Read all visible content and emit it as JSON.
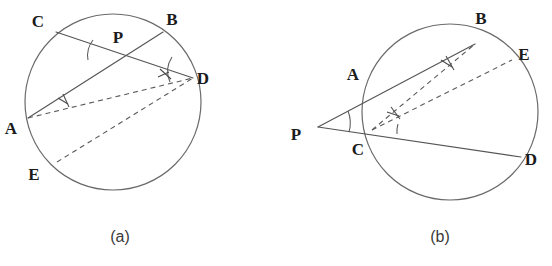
{
  "figure": {
    "background_color": "#ffffff",
    "stroke_color": "#555555",
    "label_color": "#1b1b1b",
    "caption_color": "#3a3a3a"
  },
  "panels": [
    {
      "id": "a",
      "caption": "(a)",
      "caption_x": 120,
      "caption_y": 242,
      "circle": {
        "cx": 113,
        "cy": 102,
        "r": 88
      },
      "points": [
        {
          "name": "C",
          "label": "C",
          "x": 56,
          "y": 32,
          "label_x": 38,
          "label_y": 27
        },
        {
          "name": "B",
          "label": "B",
          "x": 163,
          "y": 32,
          "label_x": 172,
          "label_y": 25
        },
        {
          "name": "P",
          "label": "P",
          "x": 110,
          "y": 48,
          "label_x": 118,
          "label_y": 43
        },
        {
          "name": "D",
          "label": "D",
          "x": 193,
          "y": 78,
          "label_x": 203,
          "label_y": 84
        },
        {
          "name": "A",
          "label": "A",
          "x": 28,
          "y": 118,
          "label_x": 11,
          "label_y": 134
        },
        {
          "name": "E",
          "label": "E",
          "x": 57,
          "y": 162,
          "label_x": 34,
          "label_y": 180
        }
      ],
      "solid_segments": [
        {
          "name": "chord-C-D",
          "from": "C",
          "to": "D"
        },
        {
          "name": "chord-A-B",
          "from": "A",
          "to": "B"
        }
      ],
      "dashed_segments": [
        {
          "name": "dashed-A-D",
          "from": "A",
          "to": "D"
        },
        {
          "name": "dashed-E-D",
          "from": "E",
          "to": "D"
        }
      ],
      "angle_marks": [
        {
          "name": "angle-at-P",
          "vertex": "P",
          "radius": 22
        },
        {
          "name": "angle-at-D",
          "vertex": "D",
          "radius": 24
        }
      ],
      "right_angle_marks": [
        {
          "name": "right-angle-at-A",
          "x": 64,
          "y": 103
        },
        {
          "name": "right-angle-near-D",
          "x": 163,
          "y": 81
        }
      ]
    },
    {
      "id": "b",
      "caption": "(b)",
      "caption_x": 440,
      "caption_y": 242,
      "circle": {
        "cx": 450,
        "cy": 112,
        "r": 88
      },
      "points": [
        {
          "name": "B",
          "label": "B",
          "x": 475,
          "y": 44,
          "label_x": 481,
          "label_y": 24
        },
        {
          "name": "E",
          "label": "E",
          "x": 512,
          "y": 60,
          "label_x": 524,
          "label_y": 60
        },
        {
          "name": "A",
          "label": "A",
          "x": 375,
          "y": 88,
          "label_x": 353,
          "label_y": 80
        },
        {
          "name": "P",
          "label": "P",
          "x": 318,
          "y": 127,
          "label_x": 296,
          "label_y": 140
        },
        {
          "name": "C",
          "label": "C",
          "x": 372,
          "y": 130,
          "label_x": 358,
          "label_y": 155
        },
        {
          "name": "D",
          "label": "D",
          "x": 521,
          "y": 157,
          "label_x": 531,
          "label_y": 165
        }
      ],
      "solid_segments": [
        {
          "name": "secant-P-A-B",
          "from": "P",
          "to": "B"
        },
        {
          "name": "secant-P-C-D",
          "from": "P",
          "to": "D"
        }
      ],
      "dashed_segments": [
        {
          "name": "dashed-C-B",
          "from": "C",
          "to": "B"
        },
        {
          "name": "dashed-C-E",
          "from": "C",
          "to": "E"
        }
      ],
      "angle_marks": [
        {
          "name": "angle-at-P",
          "vertex": "P",
          "radius": 30
        },
        {
          "name": "angle-at-C",
          "vertex": "C",
          "radius": 26
        }
      ],
      "right_angle_marks": [
        {
          "name": "right-angle-near-B",
          "x": 447,
          "y": 64
        },
        {
          "name": "right-angle-near-C",
          "x": 394,
          "y": 113
        }
      ]
    }
  ]
}
